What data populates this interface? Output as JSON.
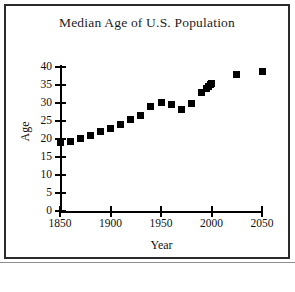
{
  "chart_data": {
    "type": "scatter",
    "title": "Median Age of U.S. Population",
    "xlabel": "Year",
    "ylabel": "Age",
    "xlim": [
      1850,
      2050
    ],
    "ylim": [
      0,
      40
    ],
    "xticks": [
      1850,
      1900,
      1950,
      2000,
      2050
    ],
    "yticks": [
      0,
      5,
      10,
      15,
      20,
      25,
      30,
      35,
      40
    ],
    "grid": false,
    "legend": "none",
    "marker": "filled-square",
    "marker_color": "#000000",
    "x": [
      1850,
      1860,
      1870,
      1880,
      1890,
      1900,
      1910,
      1920,
      1930,
      1940,
      1950,
      1960,
      1970,
      1980,
      1990,
      1995,
      1997,
      1999,
      2000,
      2025,
      2050
    ],
    "values": [
      18.9,
      19.4,
      20.2,
      20.9,
      22.0,
      22.9,
      24.1,
      25.3,
      26.4,
      29.0,
      30.2,
      29.5,
      28.1,
      30.0,
      32.9,
      34.0,
      34.7,
      35.2,
      35.3,
      38.0,
      38.7
    ],
    "points": [
      {
        "year": 1850,
        "age": 18.9
      },
      {
        "year": 1860,
        "age": 19.4
      },
      {
        "year": 1870,
        "age": 20.2
      },
      {
        "year": 1880,
        "age": 20.9
      },
      {
        "year": 1890,
        "age": 22.0
      },
      {
        "year": 1900,
        "age": 22.9
      },
      {
        "year": 1910,
        "age": 24.1
      },
      {
        "year": 1920,
        "age": 25.3
      },
      {
        "year": 1930,
        "age": 26.4
      },
      {
        "year": 1940,
        "age": 29.0
      },
      {
        "year": 1950,
        "age": 30.2
      },
      {
        "year": 1960,
        "age": 29.5
      },
      {
        "year": 1970,
        "age": 28.1
      },
      {
        "year": 1980,
        "age": 30.0
      },
      {
        "year": 1990,
        "age": 32.9
      },
      {
        "year": 1995,
        "age": 34.0
      },
      {
        "year": 1997,
        "age": 34.7
      },
      {
        "year": 1999,
        "age": 35.2
      },
      {
        "year": 2000,
        "age": 35.3
      },
      {
        "year": 2025,
        "age": 38.0
      },
      {
        "year": 2050,
        "age": 38.7
      }
    ]
  }
}
